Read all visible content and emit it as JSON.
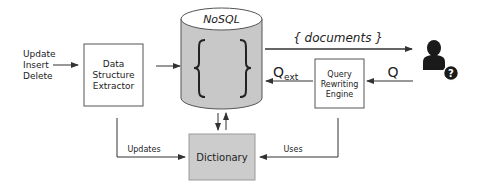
{
  "inputs": {
    "ops": [
      "Update",
      "Insert",
      "Delete"
    ]
  },
  "extractor": {
    "lines": [
      "Data",
      "Structure",
      "Extractor"
    ]
  },
  "database": {
    "title": "NoSQL",
    "content_symbol": "{ }"
  },
  "query_engine": {
    "lines": [
      "Query",
      "Rewriting",
      "Engine"
    ]
  },
  "dictionary": {
    "label": "Dictionary"
  },
  "edges": {
    "documents": "{ documents }",
    "q": "Q",
    "q_ext_main": "Q",
    "q_ext_sub": "ext",
    "updates": "Updates",
    "uses": "Uses"
  },
  "user": {
    "icon": "user-question-icon",
    "badge": "?"
  },
  "colors": {
    "db_fill": "#c8c8c8",
    "db_top": "#ffffff",
    "dict_fill": "#cccccc",
    "line": "#333333",
    "user": "#1a1a1a"
  }
}
